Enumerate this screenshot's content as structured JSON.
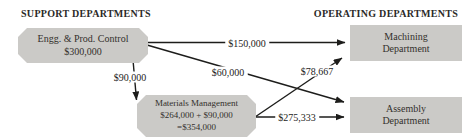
{
  "diagram": {
    "headers": {
      "support": "SUPPORT DEPARTMENTS",
      "operating": "OPERATING DEPARTMENTS"
    },
    "nodes": {
      "engg": {
        "name": "Engg. & Prod. Control",
        "amount": "$300,000"
      },
      "machining": {
        "line1": "Machining",
        "line2": "Department"
      },
      "assembly": {
        "line1": "Assembly",
        "line2": "Department"
      },
      "materials": {
        "name": "Materials Management",
        "calc": "$264,000 + $90,000",
        "total": "=$354,000"
      }
    },
    "flows": {
      "engg_to_machining": "$150,000",
      "engg_to_assembly": "$60,000",
      "engg_to_materials": "$90,000",
      "materials_to_machining": "$78,667",
      "materials_to_assembly": "$275,333"
    },
    "colors": {
      "node_fill": "#cbcac7",
      "arrow": "#1d1d1b",
      "text": "#32302c",
      "background": "#ffffff"
    }
  }
}
